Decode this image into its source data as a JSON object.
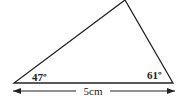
{
  "diagram": {
    "type": "triangle",
    "vertices": {
      "bottom_left": [
        14,
        83
      ],
      "bottom_right": [
        173,
        83
      ],
      "top": [
        125,
        0
      ]
    },
    "angles": {
      "bottom_left": "47º",
      "bottom_right": "61º"
    },
    "base_length": "5cm",
    "stroke_color": "#222222"
  }
}
